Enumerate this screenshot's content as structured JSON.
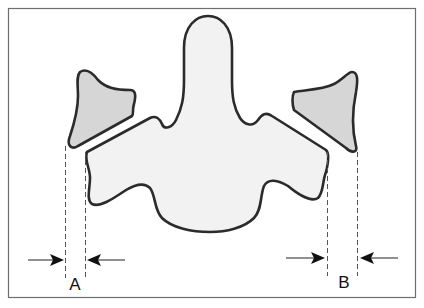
{
  "diagram": {
    "colors": {
      "frame_stroke": "#6e6e6e",
      "outline": "#2b2b2b",
      "body_fill": "#f2f2f2",
      "facet_fill": "#d6d6d6",
      "guide_lines": "#555555"
    },
    "measurements": [
      {
        "id": "A",
        "label": "A",
        "side": "left"
      },
      {
        "id": "B",
        "label": "B",
        "side": "right"
      }
    ]
  }
}
